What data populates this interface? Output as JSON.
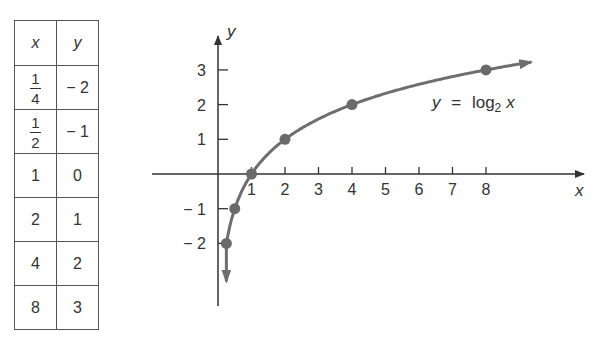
{
  "table": {
    "headers": [
      "x",
      "y"
    ],
    "rows": [
      {
        "x": "1/4",
        "x_num": "1",
        "x_den": "4",
        "y": "− 2"
      },
      {
        "x": "1/2",
        "x_num": "1",
        "x_den": "2",
        "y": "− 1"
      },
      {
        "x": "1",
        "y": "0"
      },
      {
        "x": "2",
        "y": "1"
      },
      {
        "x": "4",
        "y": "2"
      },
      {
        "x": "8",
        "y": "3"
      }
    ]
  },
  "chart_data": {
    "type": "line",
    "title": "",
    "function_label": "y = log2 x",
    "label_parts": {
      "lhs": "y",
      "eq": "=",
      "fn": "log",
      "base": "2",
      "arg": "x"
    },
    "xlabel": "x",
    "ylabel": "y",
    "x_ticks": [
      "1",
      "2",
      "3",
      "4",
      "5",
      "6",
      "7",
      "8"
    ],
    "y_ticks": [
      "3",
      "2",
      "1",
      "− 1",
      "− 2"
    ],
    "points": [
      {
        "x": 0.25,
        "y": -2
      },
      {
        "x": 0.5,
        "y": -1
      },
      {
        "x": 1,
        "y": 0
      },
      {
        "x": 2,
        "y": 1
      },
      {
        "x": 4,
        "y": 2
      },
      {
        "x": 8,
        "y": 3
      }
    ],
    "xlim": [
      -2,
      11
    ],
    "ylim": [
      -4,
      4
    ],
    "grid": false,
    "colors": {
      "curve": "#6e6e6e",
      "points": "#6a6a6a",
      "axes": "#333333"
    }
  }
}
